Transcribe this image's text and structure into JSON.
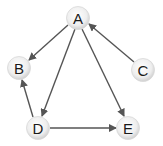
{
  "diagram": {
    "type": "directed-graph",
    "nodes": [
      {
        "id": "A",
        "label": "A",
        "x": 78,
        "y": 18
      },
      {
        "id": "B",
        "label": "B",
        "x": 19,
        "y": 68
      },
      {
        "id": "C",
        "label": "C",
        "x": 143,
        "y": 70
      },
      {
        "id": "D",
        "label": "D",
        "x": 38,
        "y": 128
      },
      {
        "id": "E",
        "label": "E",
        "x": 128,
        "y": 128
      }
    ],
    "edges": [
      {
        "from": "A",
        "to": "B"
      },
      {
        "from": "A",
        "to": "D"
      },
      {
        "from": "A",
        "to": "E"
      },
      {
        "from": "C",
        "to": "A"
      },
      {
        "from": "D",
        "to": "B"
      },
      {
        "from": "D",
        "to": "E"
      }
    ],
    "colors": {
      "edge": "#555555",
      "node_fill_center": "#ffffff",
      "node_fill_edge": "#d4d4d4",
      "label": "#1a1a1a"
    }
  }
}
